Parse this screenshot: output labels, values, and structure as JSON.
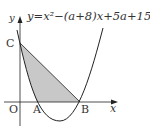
{
  "diagram": {
    "equation": "y=x²−(a+8)x+5a+15",
    "labels": {
      "y_axis": "y",
      "x_axis": "x",
      "origin": "O",
      "point_a": "A",
      "point_b": "B",
      "point_c": "C"
    },
    "colors": {
      "stroke": "#222222",
      "shade": "#c8c8c8"
    }
  }
}
